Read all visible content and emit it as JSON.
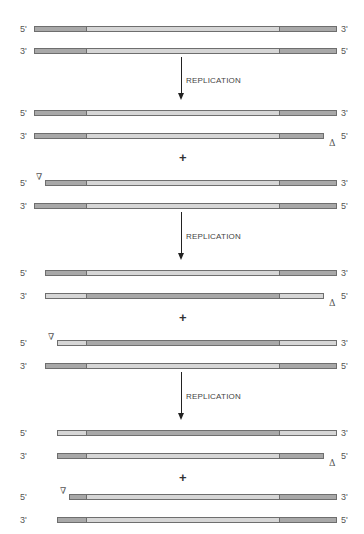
{
  "diagram": {
    "colors": {
      "dark_segment": "#a8a8a8",
      "light_segment": "#d6d6d6",
      "border": "#6e6e6e"
    },
    "step_label": "REPLICATION",
    "plus_sign": "+",
    "markers": {
      "deletion_3prime_end": "Δ",
      "start_gap": "∇"
    },
    "strands": [
      {
        "left_label": "5'",
        "right_label": "3'",
        "y": 26,
        "x1": 34,
        "x2": 337,
        "segments": [
          "dark",
          "light",
          "dark"
        ]
      },
      {
        "left_label": "3'",
        "right_label": "5'",
        "y": 48,
        "x1": 34,
        "x2": 337,
        "segments": [
          "dark",
          "light",
          "dark"
        ]
      },
      {
        "left_label": "5'",
        "right_label": "3'",
        "y": 110,
        "x1": 34,
        "x2": 337,
        "segments": [
          "dark",
          "light",
          "dark"
        ]
      },
      {
        "left_label": "3'",
        "right_label": "5'",
        "y": 133,
        "x1": 34,
        "x2": 324,
        "segments": [
          "dark",
          "light",
          "dark"
        ],
        "marker": "Δ"
      },
      {
        "left_label": "5'",
        "right_label": "3'",
        "y": 180,
        "x1": 45,
        "x2": 337,
        "segments": [
          "dark",
          "light",
          "dark"
        ],
        "marker": "∇"
      },
      {
        "left_label": "3'",
        "right_label": "5'",
        "y": 203,
        "x1": 34,
        "x2": 337,
        "segments": [
          "dark",
          "light",
          "dark"
        ]
      },
      {
        "left_label": "5'",
        "right_label": "3'",
        "y": 270,
        "x1": 45,
        "x2": 337,
        "segments": [
          "dark",
          "light",
          "dark"
        ]
      },
      {
        "left_label": "3'",
        "right_label": "5'",
        "y": 293,
        "x1": 45,
        "x2": 324,
        "segments": [
          "light",
          "dark",
          "light"
        ],
        "marker": "Δ"
      },
      {
        "left_label": "5'",
        "right_label": "3'",
        "y": 340,
        "x1": 57,
        "x2": 337,
        "segments": [
          "light",
          "dark",
          "light"
        ],
        "marker": "∇"
      },
      {
        "left_label": "3'",
        "right_label": "5'",
        "y": 363,
        "x1": 45,
        "x2": 337,
        "segments": [
          "dark",
          "light",
          "dark"
        ]
      },
      {
        "left_label": "5'",
        "right_label": "3'",
        "y": 430,
        "x1": 57,
        "x2": 337,
        "segments": [
          "light",
          "dark",
          "light"
        ]
      },
      {
        "left_label": "3'",
        "right_label": "5'",
        "y": 453,
        "x1": 57,
        "x2": 324,
        "segments": [
          "dark",
          "light",
          "dark"
        ],
        "marker": "Δ"
      },
      {
        "left_label": "5'",
        "right_label": "3'",
        "y": 494,
        "x1": 69,
        "x2": 337,
        "segments": [
          "dark",
          "light",
          "dark"
        ],
        "marker": "∇"
      },
      {
        "left_label": "3'",
        "right_label": "5'",
        "y": 517,
        "x1": 57,
        "x2": 337,
        "segments": [
          "dark",
          "light",
          "dark"
        ]
      }
    ],
    "dividers_x": [
      85,
      280
    ],
    "arrows": [
      {
        "x": 181,
        "y1": 57,
        "y2": 100,
        "label_y": 76
      },
      {
        "x": 181,
        "y1": 212,
        "y2": 260,
        "label_y": 232
      },
      {
        "x": 181,
        "y1": 372,
        "y2": 420,
        "label_y": 392
      }
    ],
    "plus_positions": [
      {
        "x": 179,
        "y": 151
      },
      {
        "x": 179,
        "y": 311
      },
      {
        "x": 179,
        "y": 471
      }
    ]
  }
}
